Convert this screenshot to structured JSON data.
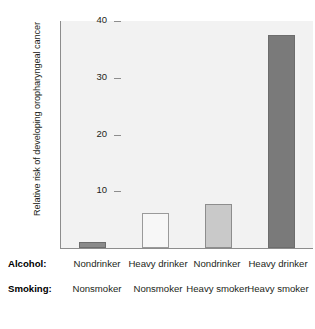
{
  "chart_data": {
    "type": "bar",
    "title": "",
    "subtitle": "",
    "xlabel": "",
    "ylabel": "Relative risk of developing oropharyngeal cancer",
    "ylim": [
      0,
      40
    ],
    "yticks": [
      10,
      20,
      30,
      40
    ],
    "ytick_labels": [
      "10",
      "20",
      "30",
      "40"
    ],
    "grid": false,
    "legend": "none",
    "categories": [
      "Nondrinker / Nonsmoker",
      "Heavy drinker / Nonsmoker",
      "Nondrinker / Heavy smoker",
      "Heavy drinker / Heavy smoker"
    ],
    "values": [
      1.0,
      6.1,
      7.7,
      37.5
    ],
    "bar_colors": [
      "#8a8a8a",
      "#f7f7f7",
      "#c9c9c9",
      "#7a7a7a"
    ],
    "bar_border_colors": [
      "#6d6d6d",
      "#9a9a9a",
      "#8d8d8d",
      "#6d6d6d"
    ],
    "group_labels": {
      "alcohol": [
        "Nondrinker",
        "Heavy drinker",
        "Nondrinker",
        "Heavy drinker"
      ],
      "smoking": [
        "Nonsmoker",
        "Nonsmoker",
        "Heavy smoker",
        "Heavy smoker"
      ]
    }
  },
  "axis": {
    "ylabel": "Relative risk of developing oropharyngeal cancer",
    "tick_40": "40",
    "tick_30": "30",
    "tick_20": "20",
    "tick_10": "10"
  },
  "rows": {
    "alcohol_title": "Alcohol:",
    "smoking_title": "Smoking:",
    "alcohol": {
      "c0": "Nondrinker",
      "c1": "Heavy\ndrinker",
      "c2": "Nondrinker",
      "c3": "Heavy\ndrinker"
    },
    "smoking": {
      "c0": "Nonsmoker",
      "c1": "Nonsmoker",
      "c2": "Heavy\nsmoker",
      "c3": "Heavy\nsmoker"
    }
  },
  "caption": {
    "text": ""
  },
  "colors": {
    "plot_background": "#f2f2f2",
    "axis_line": "#8d8d8d",
    "text": "#231f20"
  }
}
